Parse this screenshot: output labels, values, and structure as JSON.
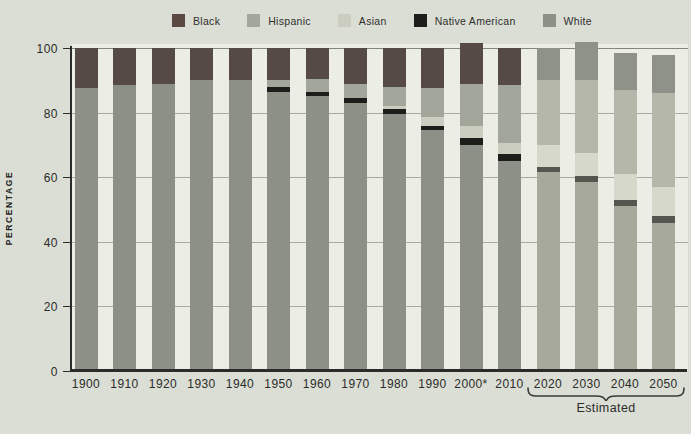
{
  "legend": {
    "items": [
      {
        "name": "Black",
        "color": "#5a4843"
      },
      {
        "name": "Hispanic",
        "color": "#a3a79b"
      },
      {
        "name": "Asian",
        "color": "#cbcdc1"
      },
      {
        "name": "Native American",
        "color": "#1d1d1b"
      },
      {
        "name": "White",
        "color": "#8d9087"
      }
    ]
  },
  "axes": {
    "y_title": "PERCENTAGE",
    "y_ticks": [
      0,
      20,
      40,
      60,
      80,
      100
    ]
  },
  "annotations": {
    "estimated_label": "Estimated",
    "estimated_categories": [
      "2020",
      "2030",
      "2040",
      "2050"
    ],
    "footnote_marker": "2000*"
  },
  "colors": {
    "page_background": "#dbded5",
    "plot_background": "#ecede5",
    "axis": "#2b2b29",
    "gridline": "#a8aba1"
  },
  "chart_data": {
    "type": "bar",
    "subtype": "stacked-vertical",
    "title": "",
    "xlabel": "",
    "ylabel": "PERCENTAGE",
    "ylim": [
      0,
      100
    ],
    "grid": true,
    "legend_position": "top",
    "categories": [
      "1900",
      "1910",
      "1920",
      "1930",
      "1940",
      "1950",
      "1960",
      "1970",
      "1980",
      "1990",
      "2000*",
      "2010",
      "2020",
      "2030",
      "2040",
      "2050"
    ],
    "estimated_from_index": 12,
    "series": [
      {
        "name": "Black",
        "values": [
          12.5,
          11.5,
          11.0,
          10.0,
          10.0,
          10.0,
          9.5,
          11.0,
          12.0,
          12.5,
          12.5,
          11.5,
          10.0,
          12.0,
          11.5,
          12.0
        ]
      },
      {
        "name": "Hispanic",
        "values": [
          0,
          0,
          0,
          0,
          0,
          2.0,
          4.0,
          4.5,
          6.0,
          9.0,
          13.0,
          18.0,
          20.0,
          22.5,
          26.0,
          29.0
        ]
      },
      {
        "name": "Asian",
        "values": [
          0,
          0,
          0,
          0,
          0,
          0,
          0,
          0,
          1.0,
          2.5,
          4.0,
          3.5,
          7.0,
          7.0,
          8.0,
          9.0
        ]
      },
      {
        "name": "Native American",
        "values": [
          0,
          0,
          0,
          0,
          0,
          1.5,
          1.5,
          1.5,
          1.5,
          1.5,
          2.0,
          2.0,
          1.5,
          2.0,
          2.0,
          2.0
        ]
      },
      {
        "name": "White",
        "values": [
          87.5,
          88.5,
          89.0,
          90.0,
          90.0,
          86.5,
          85.0,
          83.0,
          79.5,
          74.5,
          70.0,
          65.0,
          61.5,
          58.5,
          51.0,
          46.0
        ]
      }
    ],
    "palette_historical": {
      "Black": "#564a45",
      "Hispanic": "#a3a79b",
      "Asian": "#cbcdc1",
      "Native American": "#1d1d1b",
      "White": "#8d9087"
    },
    "palette_estimated": {
      "Black": "#8f9288",
      "Hispanic": "#b5b7ab",
      "Asian": "#d7d8cc",
      "Native American": "#54564f",
      "White": "#a7a99d"
    }
  }
}
